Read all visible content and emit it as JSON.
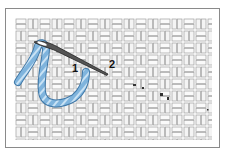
{
  "diagram": {
    "labels": [
      {
        "id": "point-1",
        "text": "1"
      },
      {
        "id": "point-2",
        "text": "2"
      }
    ],
    "colors": {
      "yarn": "#7fb4dd",
      "yarn_dark": "#3f78a8",
      "needle": "#333333",
      "canvas_line": "#9a9a9a",
      "frame": "#8a8a8a"
    }
  }
}
